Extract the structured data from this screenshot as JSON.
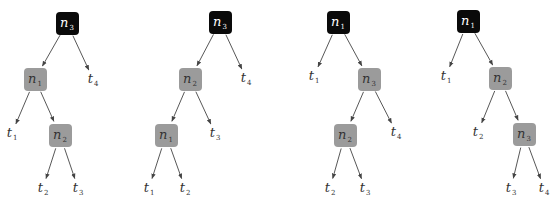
{
  "colors": {
    "root_fill": "#0a0a0a",
    "inner_fill": "#9b9b9b",
    "edge": "#444444",
    "text_dark": "#333333",
    "text_light": "#ffffff"
  },
  "trees": [
    {
      "nodes": [
        {
          "id": "r",
          "label": "n",
          "sub": "3",
          "kind": "root",
          "x": 67,
          "y": 23
        },
        {
          "id": "a",
          "label": "n",
          "sub": "1",
          "kind": "inner",
          "x": 35,
          "y": 79
        },
        {
          "id": "b",
          "label": "n",
          "sub": "2",
          "kind": "inner",
          "x": 60,
          "y": 135
        }
      ],
      "leaves": [
        {
          "id": "t4",
          "label": "t",
          "sub": "4",
          "x": 93,
          "y": 79
        },
        {
          "id": "t1",
          "label": "t",
          "sub": "1",
          "x": 12,
          "y": 133
        },
        {
          "id": "t2",
          "label": "t",
          "sub": "2",
          "x": 43,
          "y": 188
        },
        {
          "id": "t3",
          "label": "t",
          "sub": "3",
          "x": 78,
          "y": 188
        }
      ],
      "edges": [
        [
          "r",
          "a"
        ],
        [
          "r",
          "t4"
        ],
        [
          "a",
          "t1"
        ],
        [
          "a",
          "b"
        ],
        [
          "b",
          "t2"
        ],
        [
          "b",
          "t3"
        ]
      ]
    },
    {
      "nodes": [
        {
          "id": "r",
          "label": "n",
          "sub": "3",
          "kind": "root",
          "x": 220,
          "y": 22
        },
        {
          "id": "a",
          "label": "n",
          "sub": "2",
          "kind": "inner",
          "x": 190,
          "y": 79
        },
        {
          "id": "b",
          "label": "n",
          "sub": "1",
          "kind": "inner",
          "x": 166,
          "y": 135
        }
      ],
      "leaves": [
        {
          "id": "t4",
          "label": "t",
          "sub": "4",
          "x": 246,
          "y": 78
        },
        {
          "id": "t3",
          "label": "t",
          "sub": "3",
          "x": 215,
          "y": 133
        },
        {
          "id": "t1",
          "label": "t",
          "sub": "1",
          "x": 149,
          "y": 188
        },
        {
          "id": "t2",
          "label": "t",
          "sub": "2",
          "x": 185,
          "y": 188
        }
      ],
      "edges": [
        [
          "r",
          "a"
        ],
        [
          "r",
          "t4"
        ],
        [
          "a",
          "b"
        ],
        [
          "a",
          "t3"
        ],
        [
          "b",
          "t1"
        ],
        [
          "b",
          "t2"
        ]
      ]
    },
    {
      "nodes": [
        {
          "id": "r",
          "label": "n",
          "sub": "1",
          "kind": "root",
          "x": 338,
          "y": 22
        },
        {
          "id": "a",
          "label": "n",
          "sub": "3",
          "kind": "inner",
          "x": 369,
          "y": 79
        },
        {
          "id": "b",
          "label": "n",
          "sub": "2",
          "kind": "inner",
          "x": 345,
          "y": 135
        }
      ],
      "leaves": [
        {
          "id": "t1",
          "label": "t",
          "sub": "1",
          "x": 314,
          "y": 76
        },
        {
          "id": "t4",
          "label": "t",
          "sub": "4",
          "x": 396,
          "y": 132
        },
        {
          "id": "t2",
          "label": "t",
          "sub": "2",
          "x": 330,
          "y": 188
        },
        {
          "id": "t3",
          "label": "t",
          "sub": "3",
          "x": 365,
          "y": 188
        }
      ],
      "edges": [
        [
          "r",
          "t1"
        ],
        [
          "r",
          "a"
        ],
        [
          "a",
          "b"
        ],
        [
          "a",
          "t4"
        ],
        [
          "b",
          "t2"
        ],
        [
          "b",
          "t3"
        ]
      ]
    },
    {
      "nodes": [
        {
          "id": "r",
          "label": "n",
          "sub": "1",
          "kind": "root",
          "x": 468,
          "y": 21
        },
        {
          "id": "a",
          "label": "n",
          "sub": "2",
          "kind": "inner",
          "x": 500,
          "y": 78
        },
        {
          "id": "b",
          "label": "n",
          "sub": "3",
          "kind": "inner",
          "x": 524,
          "y": 134
        }
      ],
      "leaves": [
        {
          "id": "t1",
          "label": "t",
          "sub": "1",
          "x": 446,
          "y": 76
        },
        {
          "id": "t2",
          "label": "t",
          "sub": "2",
          "x": 478,
          "y": 132
        },
        {
          "id": "t3",
          "label": "t",
          "sub": "3",
          "x": 511,
          "y": 188
        },
        {
          "id": "t4",
          "label": "t",
          "sub": "4",
          "x": 544,
          "y": 188
        }
      ],
      "edges": [
        [
          "r",
          "t1"
        ],
        [
          "r",
          "a"
        ],
        [
          "a",
          "t2"
        ],
        [
          "a",
          "b"
        ],
        [
          "b",
          "t3"
        ],
        [
          "b",
          "t4"
        ]
      ]
    }
  ]
}
